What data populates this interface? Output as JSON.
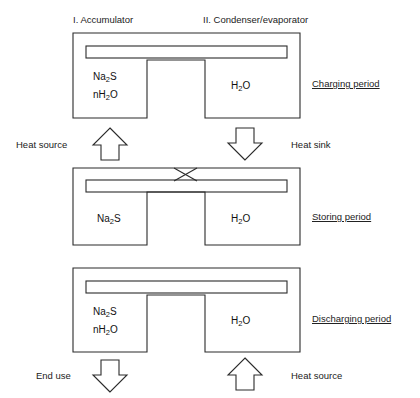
{
  "figure": {
    "column_headers": [
      {
        "id": "accumulator",
        "label": "I. Accumulator"
      },
      {
        "id": "condenser-evaporator",
        "label": "II. Condenser/evaporator"
      }
    ],
    "stages": [
      {
        "id": "charging",
        "period_label": "Charging period",
        "accumulator_lines": [
          "Na2S",
          "nH2O"
        ],
        "accumulator_formula_html": "Na<sub>2</sub>S",
        "accumulator_hydrate_html": "nH<sub>2</sub>O",
        "condenser_label_html": "H<sub>2</sub>O",
        "condenser_label": "H2O",
        "valve_state": "open",
        "left_flow": {
          "direction": "up",
          "label": "Heat source"
        },
        "right_flow": {
          "direction": "down",
          "label": "Heat sink"
        }
      },
      {
        "id": "storing",
        "period_label": "Storing period",
        "accumulator_lines": [
          "Na2S"
        ],
        "accumulator_formula_html": "Na<sub>2</sub>S",
        "accumulator_hydrate_html": "",
        "condenser_label_html": "H<sub>2</sub>O",
        "condenser_label": "H2O",
        "valve_state": "closed",
        "left_flow": {
          "direction": "none",
          "label": ""
        },
        "right_flow": {
          "direction": "none",
          "label": ""
        }
      },
      {
        "id": "discharging",
        "period_label": "Discharging period",
        "accumulator_lines": [
          "Na2S",
          "nH2O"
        ],
        "accumulator_formula_html": "Na<sub>2</sub>S",
        "accumulator_hydrate_html": "nH<sub>2</sub>O",
        "condenser_label_html": "H<sub>2</sub>O",
        "condenser_label": "H2O",
        "valve_state": "open",
        "left_flow": {
          "direction": "down",
          "label": "End use"
        },
        "right_flow": {
          "direction": "up",
          "label": "Heat source"
        }
      }
    ],
    "colors": {
      "stroke": "#2b2b2b",
      "background": "#ffffff",
      "text": "#222222"
    }
  }
}
